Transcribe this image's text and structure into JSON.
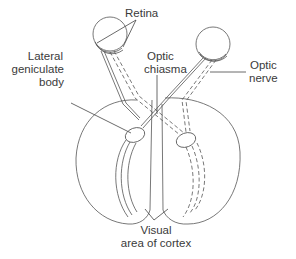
{
  "diagram": {
    "labels": {
      "retina": "Retina",
      "optic_chiasma_line1": "Optic",
      "optic_chiasma_line2": "chiasma",
      "lgb_line1": "Lateral",
      "lgb_line2": "geniculate",
      "lgb_line3": "body",
      "optic_nerve_line1": "Optic",
      "optic_nerve_line2": "nerve",
      "visual_cortex_line1": "Visual",
      "visual_cortex_line2": "area of cortex"
    },
    "legend": {
      "solid_lines": "fibres from left side of each retina",
      "dashed_lines": "fibres from right side of each retina"
    },
    "colors": {
      "background": "#ffffff",
      "stroke": "#555555",
      "text": "#3a3a3a"
    }
  }
}
